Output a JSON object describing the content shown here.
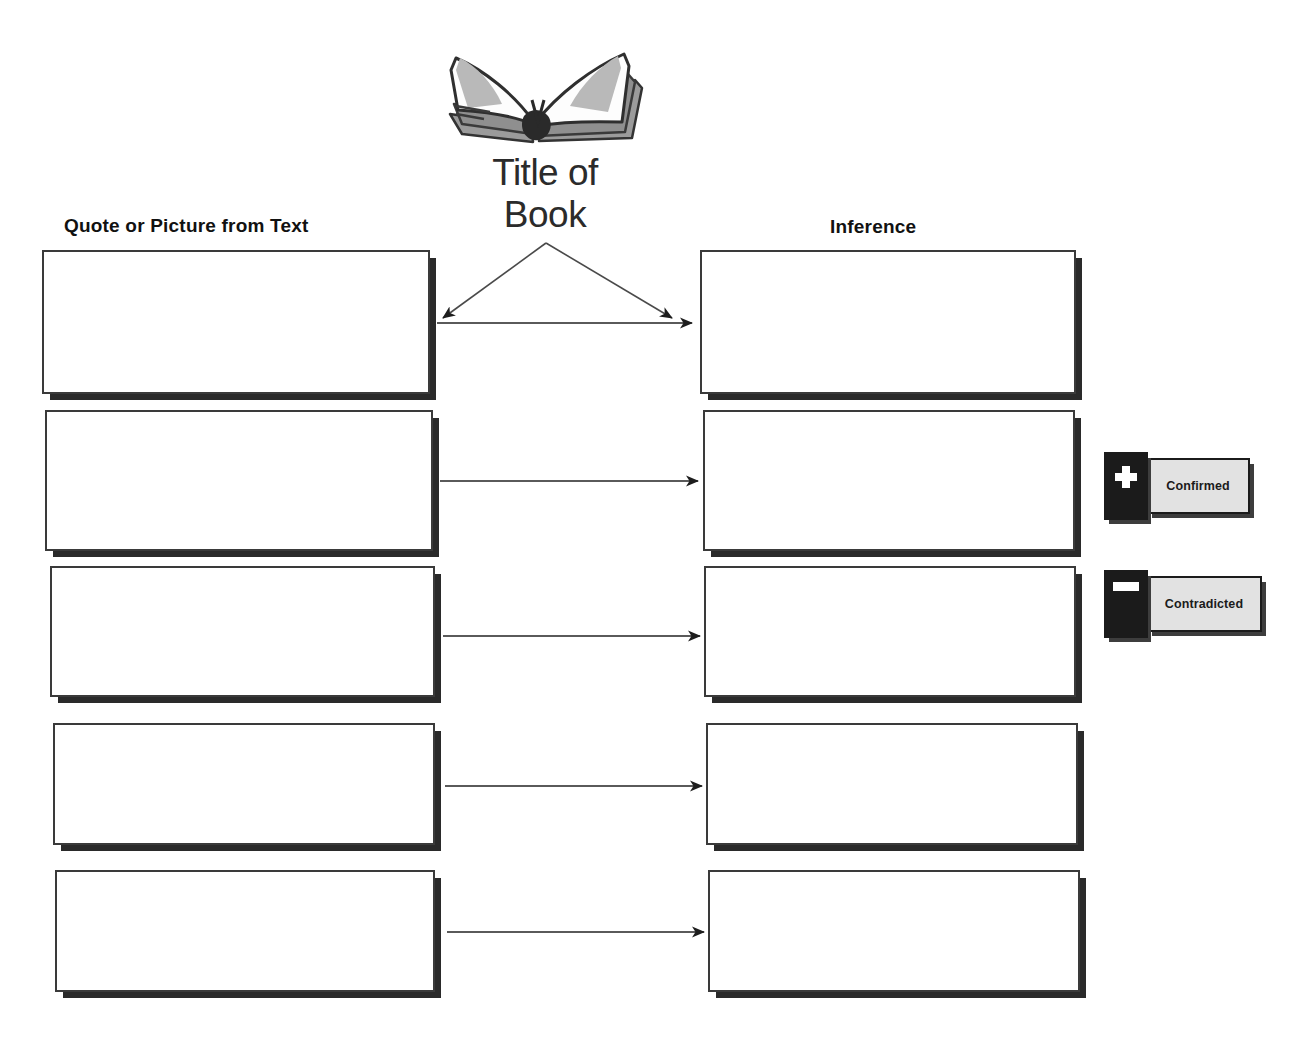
{
  "document": {
    "kind": "graphic-organizer-worksheet",
    "background_color": "#ffffff",
    "ink_color": "#1a1a1a"
  },
  "book": {
    "icon_name": "open-book-icon",
    "title_text": "Title of\nBook"
  },
  "columns": [
    {
      "id": "quote",
      "heading": "Quote or Picture from Text"
    },
    {
      "id": "inference",
      "heading": "Inference"
    }
  ],
  "rows": [
    {
      "index": 1,
      "quote_value": "",
      "inference_value": "",
      "connector": "split-and-straight"
    },
    {
      "index": 2,
      "quote_value": "",
      "inference_value": "",
      "connector": "straight"
    },
    {
      "index": 3,
      "quote_value": "",
      "inference_value": "",
      "connector": "straight"
    },
    {
      "index": 4,
      "quote_value": "",
      "inference_value": "",
      "connector": "straight"
    },
    {
      "index": 5,
      "quote_value": "",
      "inference_value": "",
      "connector": "straight"
    }
  ],
  "box_placeholder": "",
  "legend": {
    "items": [
      {
        "id": "confirmed",
        "glyph": "plus-icon",
        "label": "Confirmed",
        "badge_color": "#1b1b1b",
        "body_color": "#e2e2e2"
      },
      {
        "id": "contradicted",
        "glyph": "minus-icon",
        "label": "Contradicted",
        "badge_color": "#1b1b1b",
        "body_color": "#e2e2e2"
      }
    ]
  },
  "geometry": {
    "left_boxes": [
      {
        "x": 42,
        "y": 250,
        "w": 388,
        "h": 144
      },
      {
        "x": 45,
        "y": 410,
        "w": 388,
        "h": 141
      },
      {
        "x": 50,
        "y": 566,
        "w": 385,
        "h": 131
      },
      {
        "x": 53,
        "y": 723,
        "w": 382,
        "h": 122
      },
      {
        "x": 55,
        "y": 870,
        "w": 380,
        "h": 122
      }
    ],
    "right_boxes": [
      {
        "x": 700,
        "y": 250,
        "w": 376,
        "h": 144
      },
      {
        "x": 703,
        "y": 410,
        "w": 372,
        "h": 141
      },
      {
        "x": 704,
        "y": 566,
        "w": 372,
        "h": 131
      },
      {
        "x": 706,
        "y": 723,
        "w": 372,
        "h": 122
      },
      {
        "x": 708,
        "y": 870,
        "w": 372,
        "h": 122
      }
    ]
  }
}
